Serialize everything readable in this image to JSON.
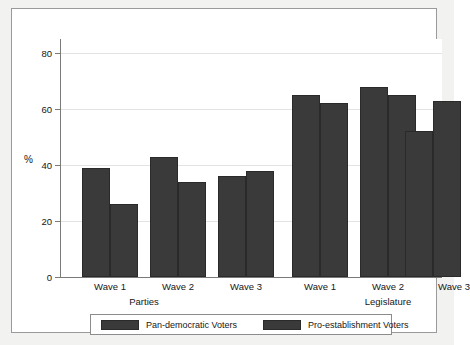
{
  "chart_data": {
    "type": "bar",
    "title": "",
    "subtitle": "",
    "xlabel": "",
    "ylabel": "%",
    "ylim": [
      0,
      85
    ],
    "yticks": [
      0,
      20,
      40,
      60,
      80
    ],
    "ytick_labels": [
      "0",
      "20",
      "40",
      "60",
      "80"
    ],
    "grid": true,
    "grid_axis": "y",
    "legend_position": "bottom",
    "groups": [
      "Parties",
      "Legislature"
    ],
    "categories": [
      "Wave 1",
      "Wave 2",
      "Wave 3",
      "Wave 1",
      "Wave 2",
      "Wave 3"
    ],
    "series": [
      {
        "name": "Pan-democratic Voters",
        "color": "#3a3a3a",
        "values": [
          39,
          43,
          36,
          65,
          68,
          52
        ]
      },
      {
        "name": "Pro-establishment Voters",
        "color": "#3a3a3a",
        "values": [
          26,
          34,
          38,
          62,
          65,
          63
        ]
      }
    ],
    "group_data": [
      {
        "group": "Parties",
        "waves": [
          {
            "wave": "Wave 1",
            "pan_democratic": 39,
            "pro_establishment": 26
          },
          {
            "wave": "Wave 2",
            "pan_democratic": 43,
            "pro_establishment": 34
          },
          {
            "wave": "Wave 3",
            "pan_democratic": 36,
            "pro_establishment": 38
          }
        ]
      },
      {
        "group": "Legislature",
        "waves": [
          {
            "wave": "Wave 1",
            "pan_democratic": 65,
            "pro_establishment": 62
          },
          {
            "wave": "Wave 2",
            "pan_democratic": 68,
            "pro_establishment": 65
          },
          {
            "wave": "Wave 3",
            "pan_democratic": 52,
            "pro_establishment": 63
          }
        ]
      }
    ]
  },
  "axis": {
    "y_label": "%",
    "ticks": [
      {
        "value": 80,
        "label": "80"
      },
      {
        "value": 60,
        "label": "60"
      },
      {
        "value": 40,
        "label": "40"
      },
      {
        "value": 20,
        "label": "20"
      },
      {
        "value": 0,
        "label": "0"
      }
    ]
  },
  "categories": [
    {
      "label": "Wave 1"
    },
    {
      "label": "Wave 2"
    },
    {
      "label": "Wave 3"
    },
    {
      "label": "Wave 1"
    },
    {
      "label": "Wave 2"
    },
    {
      "label": "Wave 3"
    }
  ],
  "groups": [
    {
      "label": "Parties"
    },
    {
      "label": "Legislature"
    }
  ],
  "legend": {
    "items": [
      {
        "label": "Pan-democratic Voters",
        "color": "#3a3a3a"
      },
      {
        "label": "Pro-establishment Voters",
        "color": "#3a3a3a"
      }
    ]
  },
  "colors": {
    "bar": "#3a3a3a",
    "bar_border": "#2a2a2a",
    "grid": "#e3e3e3",
    "axis": "#7a7a7a",
    "plot_background": "#ffffff",
    "figure_background": "#f2f2f0",
    "frame_border": "#9a9a9a"
  }
}
